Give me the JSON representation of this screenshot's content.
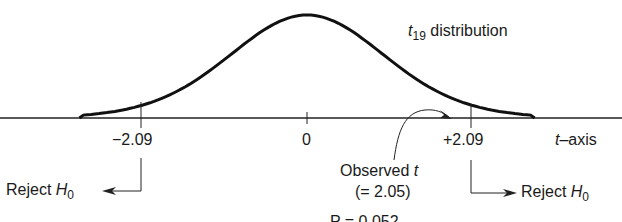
{
  "chart_data": {
    "type": "line",
    "title": "t19 distribution",
    "distribution": "Student t",
    "degrees_of_freedom": 19,
    "xlabel": "t-axis",
    "ylabel": "",
    "x_ticks": [
      -2.09,
      0,
      2.09
    ],
    "x_tick_labels": [
      "−2.09",
      "0",
      "+2.09"
    ],
    "critical_values": [
      -2.09,
      2.09
    ],
    "observed_t": 2.05,
    "annotations": [
      {
        "text": "Reject H0",
        "side": "left",
        "arrow": "left",
        "at": -2.09
      },
      {
        "text": "Reject H0",
        "side": "right",
        "arrow": "right",
        "at": 2.09
      },
      {
        "text": "Observed t (= 2.05)",
        "points_to": 2.05
      }
    ],
    "grid": false,
    "legend": "none"
  },
  "labels": {
    "dist_t": "t",
    "dist_sub": "19",
    "dist_rest": " distribution",
    "tick_left": "−2.09",
    "tick_zero": "0",
    "tick_right": "+2.09",
    "axis_t": "t",
    "axis_rest": "–axis",
    "reject": "Reject ",
    "h": "H",
    "h_sub": "0",
    "observed": "Observed ",
    "observed_t": "t",
    "observed_value": "(= 2.05)",
    "cut_text": "P = 0.052"
  }
}
